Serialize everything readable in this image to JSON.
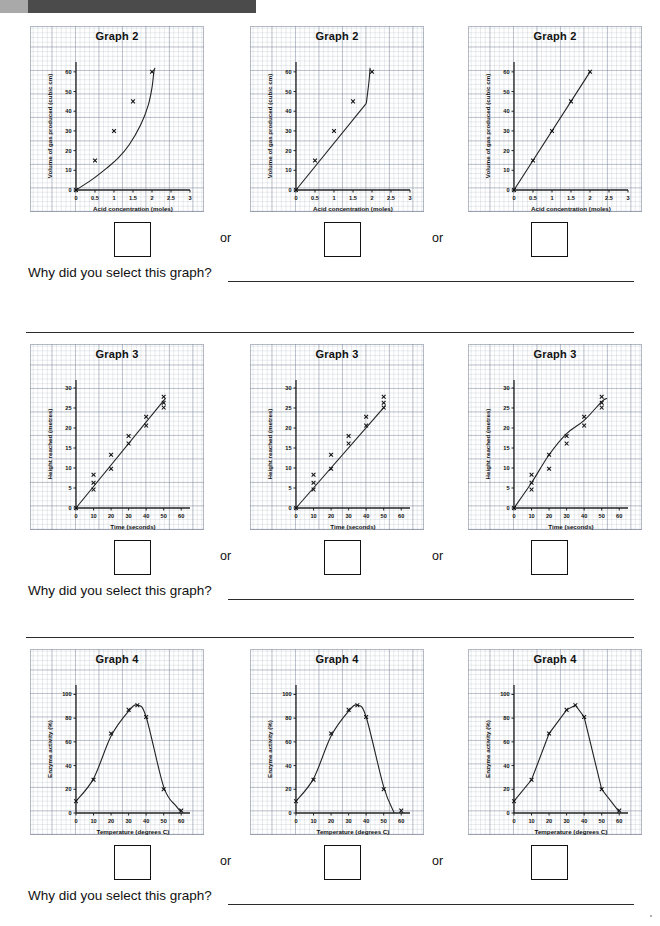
{
  "page": {
    "scan_bar_color": "#4b4b4b",
    "question_prompt": "Why did you select this graph?",
    "or_label": "or"
  },
  "sections": [
    {
      "id": "graph-2",
      "graph_title": "Graph 2",
      "chart_data": {
        "type": "scatter",
        "title": "Graph 2",
        "xlabel": "Acid concentration (moles)",
        "ylabel": "Volume of gas produced (cubic cm)",
        "xlim": [
          0,
          3
        ],
        "ylim": [
          0,
          65
        ],
        "xticks": [
          0,
          0.5,
          1,
          1.5,
          2,
          2.5,
          3
        ],
        "xticklabels": [
          "0",
          "0.5",
          "1",
          "1.5",
          "2",
          "2.5",
          "3"
        ],
        "yticks": [
          0,
          10,
          20,
          30,
          40,
          50,
          60
        ],
        "yticklabels": [
          "0",
          "10",
          "20",
          "30",
          "40",
          "50",
          "60"
        ],
        "grid": true,
        "marker": "x",
        "points": [
          {
            "x": 0,
            "y": 0
          },
          {
            "x": 0.5,
            "y": 15
          },
          {
            "x": 1,
            "y": 30
          },
          {
            "x": 1.5,
            "y": 45
          },
          {
            "x": 2,
            "y": 60
          }
        ],
        "variants": [
          {
            "name": "exponential-curve",
            "fit": "curve bending steeply upward through origin, rising near x=2.1"
          },
          {
            "name": "kinked-line",
            "fit": "straight line to (1.85,44) then sharp vertical kink up to (1.95,60)"
          },
          {
            "name": "straight-line",
            "fit": "perfect straight line of best fit through all points"
          }
        ]
      }
    },
    {
      "id": "graph-3",
      "graph_title": "Graph 3",
      "chart_data": {
        "type": "scatter",
        "title": "Graph 3",
        "xlabel": "Time (seconds)",
        "ylabel": "Height reached (metres)",
        "xlim": [
          0,
          65
        ],
        "ylim": [
          0,
          32
        ],
        "xticks": [
          0,
          10,
          20,
          30,
          40,
          50,
          60
        ],
        "xticklabels": [
          "0",
          "10",
          "20",
          "30",
          "40",
          "50",
          "60"
        ],
        "yticks": [
          0,
          5,
          10,
          15,
          20,
          25,
          30
        ],
        "yticklabels": [
          "0",
          "5",
          "10",
          "15",
          "20",
          "25",
          "30"
        ],
        "grid": true,
        "marker": "x",
        "points": [
          {
            "x": 0,
            "y": 0
          },
          {
            "x": 10,
            "y": 8.3
          },
          {
            "x": 10,
            "y": 6.3
          },
          {
            "x": 10,
            "y": 4.6
          },
          {
            "x": 20,
            "y": 13.3
          },
          {
            "x": 20,
            "y": 9.8
          },
          {
            "x": 30,
            "y": 18.0
          },
          {
            "x": 30,
            "y": 16.1
          },
          {
            "x": 40,
            "y": 22.8
          },
          {
            "x": 40,
            "y": 20.6
          },
          {
            "x": 50,
            "y": 27.8
          },
          {
            "x": 50,
            "y": 26.3
          },
          {
            "x": 50,
            "y": 25.1
          }
        ],
        "variants": [
          {
            "name": "line-of-best-fit",
            "fit": "single straight line of best fit through the scatter"
          },
          {
            "name": "line-through-low-points",
            "fit": "straight line passing through the lower cluster points"
          },
          {
            "name": "dot-to-dot-curve",
            "fit": "wiggly line joining point to point"
          }
        ]
      }
    },
    {
      "id": "graph-4",
      "graph_title": "Graph 4",
      "chart_data": {
        "type": "scatter",
        "title": "Graph 4",
        "xlabel": "Temperature (degrees C)",
        "ylabel": "Enzyme activity (%)",
        "xlim": [
          0,
          65
        ],
        "ylim": [
          0,
          108
        ],
        "xticks": [
          0,
          10,
          20,
          30,
          40,
          50,
          60
        ],
        "xticklabels": [
          "0",
          "10",
          "20",
          "30",
          "40",
          "50",
          "60"
        ],
        "yticks": [
          0,
          20,
          40,
          60,
          80,
          100
        ],
        "yticklabels": [
          "0",
          "20",
          "40",
          "60",
          "80",
          "100"
        ],
        "grid": true,
        "marker": "x",
        "points": [
          {
            "x": 0,
            "y": 10
          },
          {
            "x": 10,
            "y": 28
          },
          {
            "x": 20,
            "y": 67
          },
          {
            "x": 30,
            "y": 87
          },
          {
            "x": 35,
            "y": 91
          },
          {
            "x": 40,
            "y": 81
          },
          {
            "x": 50,
            "y": 20
          },
          {
            "x": 60,
            "y": 2
          }
        ],
        "variants": [
          {
            "name": "smooth-bell-curve",
            "fit": "smooth curve of best fit through all points down to 60"
          },
          {
            "name": "curve-missing-last-point",
            "fit": "smooth curve that falls to zero near x=56, missing point at 60"
          },
          {
            "name": "dot-to-dot-straight-segments",
            "fit": "straight segments joining each point"
          }
        ]
      }
    }
  ]
}
